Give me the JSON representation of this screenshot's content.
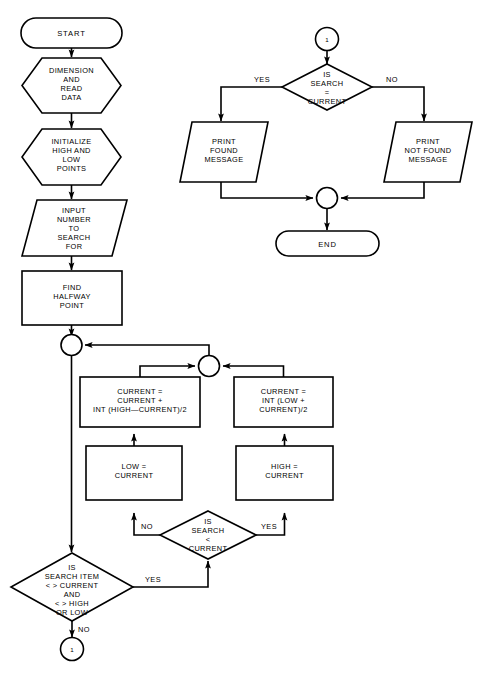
{
  "diagram": {
    "background_color": "#ffffff",
    "line_color": "#000000"
  },
  "nodes": {
    "start": {
      "type": "terminal",
      "label": "START"
    },
    "dimension_read": {
      "type": "preparation",
      "line1": "DIMENSION",
      "line2": "AND",
      "line3": "READ",
      "line4": "DATA"
    },
    "initialize": {
      "type": "preparation",
      "line1": "INITIALIZE",
      "line2": "HIGH AND",
      "line3": "LOW",
      "line4": "POINTS"
    },
    "input_number": {
      "type": "input",
      "line1": "INPUT",
      "line2": "NUMBER",
      "line3": "TO",
      "line4": "SEARCH",
      "line5": "FOR"
    },
    "find_halfway": {
      "type": "process",
      "line1": "FIND",
      "line2": "HALFWAY",
      "line3": "POINT"
    },
    "junction_left": {
      "type": "connector",
      "label": ""
    },
    "junction_mid": {
      "type": "connector",
      "label": ""
    },
    "current_high": {
      "type": "process",
      "line1": "CURRENT =",
      "line2": "CURRENT +",
      "line3": "INT (HIGH—CURRENT)/2"
    },
    "current_low": {
      "type": "process",
      "line1": "CURRENT =",
      "line2": "INT (LOW +",
      "line3": "CURRENT)/2"
    },
    "low_assign": {
      "type": "process",
      "line1": "LOW =",
      "line2": "CURRENT"
    },
    "high_assign": {
      "type": "process",
      "line1": "HIGH =",
      "line2": "CURRENT"
    },
    "decision_less": {
      "type": "decision",
      "line1": "IS",
      "line2": "SEARCH",
      "line3": "<",
      "line4": "CURRENT"
    },
    "decision_item": {
      "type": "decision",
      "line1": "IS",
      "line2": "SEARCH ITEM",
      "line3": "< > CURRENT",
      "line4": "AND",
      "line5": "< > HIGH",
      "line6": "OR LOW"
    },
    "connector_out": {
      "type": "connector",
      "label": "1"
    },
    "connector_in": {
      "type": "connector",
      "label": "1"
    },
    "decision_equal": {
      "type": "decision",
      "line1": "IS",
      "line2": "SEARCH",
      "line3": "=",
      "line4": "CURRENT"
    },
    "print_found": {
      "type": "output",
      "line1": "PRINT",
      "line2": "FOUND",
      "line3": "MESSAGE"
    },
    "print_not_found": {
      "type": "output",
      "line1": "PRINT",
      "line2": "NOT FOUND",
      "line3": "MESSAGE"
    },
    "junction_end": {
      "type": "connector",
      "label": ""
    },
    "end": {
      "type": "terminal",
      "label": "END"
    }
  },
  "edge_labels": {
    "equal_yes": "YES",
    "equal_no": "NO",
    "less_no": "NO",
    "less_yes": "YES",
    "item_yes": "YES",
    "item_no": "NO"
  }
}
